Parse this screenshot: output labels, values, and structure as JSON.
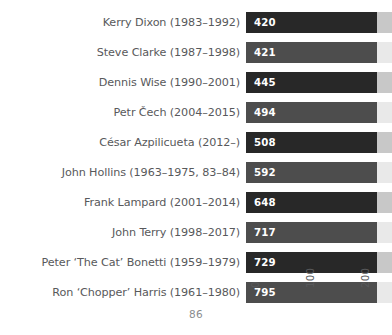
{
  "page": {
    "number": "86"
  },
  "chart_data": {
    "type": "bar",
    "orientation": "horizontal",
    "title": "",
    "subtitle": "",
    "xlabel": "",
    "ylabel": "",
    "grid": false,
    "legend": null,
    "xlim": [
      0,
      265
    ],
    "xticks": [
      "0",
      "100",
      "200"
    ],
    "xtick_values": [
      0,
      100,
      200
    ],
    "xtick_rotation": -90,
    "note": "Bars are cropped at the right edge of the page; the pale track shows the remainder of the plotting area.",
    "colors": {
      "bar_dark": "#282828",
      "bar_mid": "#4d4d4d",
      "track_dark": "#c8c8c8",
      "track_light": "#e9e9e9",
      "label_text": "#58595b",
      "value_text": "#ffffff",
      "background": "#ffffff"
    },
    "categories": [
      "Kerry Dixon (1983–1992)",
      "Steve Clarke (1987–1998)",
      "Dennis Wise (1990–2001)",
      "Petr Čech (2004–2015)",
      "César Azpilicueta (2012–)",
      "John Hollins (1963–1975, 83–84)",
      "Frank Lampard (2001–2014)",
      "John Terry (1998–2017)",
      "Peter ‘The Cat’ Bonetti (1959–1979)",
      "Ron ‘Chopper’ Harris (1961–1980)"
    ],
    "values": [
      420,
      421,
      445,
      494,
      508,
      592,
      648,
      717,
      729,
      795
    ],
    "value_labels": [
      "420",
      "421",
      "445",
      "494",
      "508",
      "592",
      "648",
      "717",
      "729",
      "795"
    ],
    "bars": [
      {
        "label": "Kerry Dixon (1983–1992)",
        "value": 420,
        "value_label": "420",
        "shade": "dark"
      },
      {
        "label": "Steve Clarke (1987–1998)",
        "value": 421,
        "value_label": "421",
        "shade": "mid"
      },
      {
        "label": "Dennis Wise (1990–2001)",
        "value": 445,
        "value_label": "445",
        "shade": "dark"
      },
      {
        "label": "Petr Čech (2004–2015)",
        "value": 494,
        "value_label": "494",
        "shade": "mid"
      },
      {
        "label": "César Azpilicueta (2012–)",
        "value": 508,
        "value_label": "508",
        "shade": "dark"
      },
      {
        "label": "John Hollins (1963–1975, 83–84)",
        "value": 592,
        "value_label": "592",
        "shade": "mid"
      },
      {
        "label": "Frank Lampard (2001–2014)",
        "value": 648,
        "value_label": "648",
        "shade": "dark"
      },
      {
        "label": "John Terry (1998–2017)",
        "value": 717,
        "value_label": "717",
        "shade": "mid"
      },
      {
        "label": "Peter ‘The Cat’ Bonetti (1959–1979)",
        "value": 729,
        "value_label": "729",
        "shade": "dark"
      },
      {
        "label": "Ron ‘Chopper’ Harris (1961–1980)",
        "value": 795,
        "value_label": "795",
        "shade": "mid"
      }
    ]
  }
}
